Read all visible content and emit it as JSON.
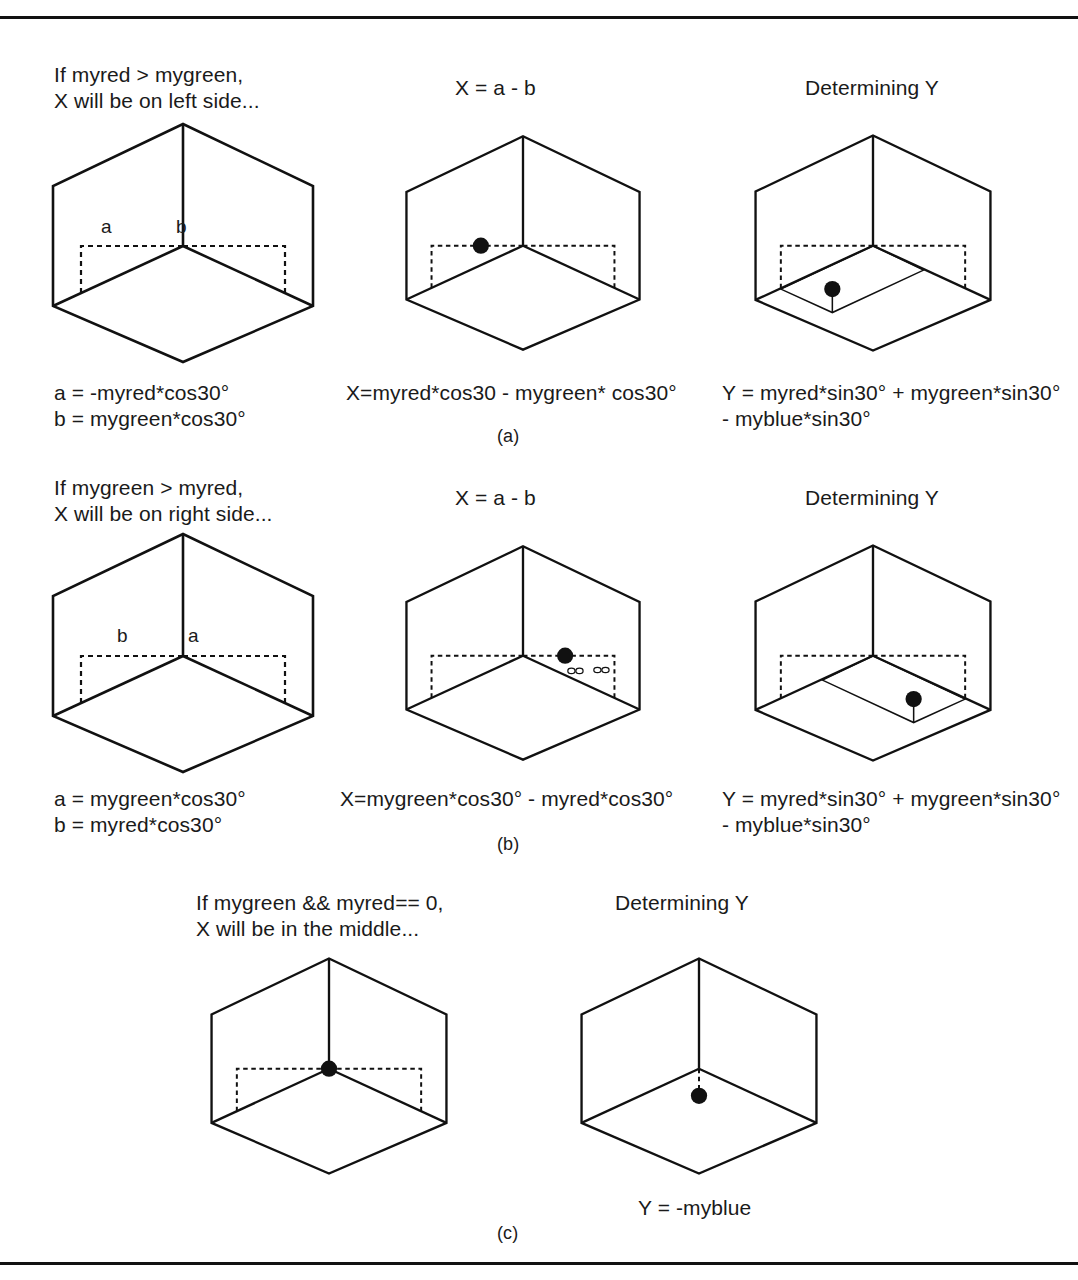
{
  "figure": {
    "title_implicit": "Determining X and Y from myred, mygreen, myblue on an isometric cube",
    "panel_labels": {
      "a": "(a)",
      "b": "(b)",
      "c": "(c)"
    },
    "ink_color": "#111111",
    "background_color": "#ffffff"
  },
  "rows": [
    {
      "id": "a",
      "label": "(a)",
      "panels": [
        {
          "id": "a1",
          "heading_lines": [
            "If myred > mygreen,",
            "X will be on left side..."
          ],
          "cube_labels": {
            "left": "a",
            "right": "b"
          },
          "caption_lines": [
            "a = -myred*cos30°",
            "b = mygreen*cos30°"
          ],
          "dot": "none"
        },
        {
          "id": "a2",
          "heading_lines": [
            "X = a - b"
          ],
          "caption_lines": [
            "X=myred*cos30 - mygreen* cos30°"
          ],
          "dot": "left-of-center-on-dashed-line"
        },
        {
          "id": "a3",
          "heading_lines": [
            "Determining Y"
          ],
          "caption_lines": [
            "Y = myred*sin30° + mygreen*sin30°",
            "- myblue*sin30°"
          ],
          "dot": "on-floor-left-with-stem"
        }
      ]
    },
    {
      "id": "b",
      "label": "(b)",
      "panels": [
        {
          "id": "b1",
          "heading_lines": [
            "If mygreen > myred,",
            "X will be on right side..."
          ],
          "cube_labels": {
            "left": "b",
            "right": "a"
          },
          "caption_lines": [
            "a = mygreen*cos30°",
            "b = myred*cos30°"
          ],
          "dot": "none"
        },
        {
          "id": "b2",
          "heading_lines": [
            "X = a - b"
          ],
          "caption_lines": [
            "X=mygreen*cos30° - myred*cos30°"
          ],
          "dot": "right-of-center-on-dashed-line"
        },
        {
          "id": "b3",
          "heading_lines": [
            "Determining Y"
          ],
          "caption_lines": [
            "Y = myred*sin30° + mygreen*sin30°",
            "- myblue*sin30°"
          ],
          "dot": "on-floor-right-with-stem"
        }
      ]
    },
    {
      "id": "c",
      "label": "(c)",
      "panels": [
        {
          "id": "c1",
          "heading_lines": [
            "If mygreen && myred== 0,",
            "X will be in the middle..."
          ],
          "caption_lines": [],
          "dot": "at-center-vertex"
        },
        {
          "id": "c2",
          "heading_lines": [
            "Determining Y"
          ],
          "caption_lines": [
            "Y = -myblue"
          ],
          "dot": "below-center-with-dashed-stem"
        }
      ]
    }
  ]
}
